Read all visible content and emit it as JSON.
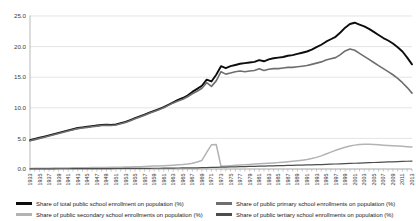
{
  "chart_data": {
    "type": "line",
    "title": "",
    "xlabel": "",
    "ylabel": "",
    "ylim": [
      0,
      25
    ],
    "yticks": [
      "0.0",
      "5.0",
      "10.0",
      "15.0",
      "20.0",
      "25.0"
    ],
    "grid": true,
    "legend_position": "bottom",
    "x": [
      1933,
      1934,
      1935,
      1936,
      1937,
      1938,
      1939,
      1940,
      1941,
      1942,
      1943,
      1944,
      1945,
      1946,
      1947,
      1948,
      1949,
      1950,
      1951,
      1952,
      1953,
      1954,
      1955,
      1956,
      1957,
      1958,
      1959,
      1960,
      1961,
      1962,
      1963,
      1964,
      1965,
      1966,
      1967,
      1968,
      1969,
      1970,
      1971,
      1972,
      1973,
      1974,
      1975,
      1976,
      1977,
      1978,
      1979,
      1980,
      1981,
      1982,
      1983,
      1984,
      1985,
      1986,
      1987,
      1988,
      1989,
      1990,
      1991,
      1992,
      1993,
      1994,
      1995,
      1996,
      1997,
      1998,
      1999,
      2000,
      2001,
      2002,
      2003,
      2004,
      2005,
      2006,
      2007,
      2008,
      2009,
      2010,
      2011,
      2012,
      2013
    ],
    "xticklabels": [
      "1933",
      "1935",
      "1937",
      "1939",
      "1941",
      "1943",
      "1945",
      "1947",
      "1949",
      "1951",
      "1953",
      "1955",
      "1957",
      "1959",
      "1961",
      "1963",
      "1965",
      "1967",
      "1969",
      "1971",
      "1973",
      "1975",
      "1977",
      "1979",
      "1981",
      "1983",
      "1985",
      "1987",
      "1989",
      "1991",
      "1993",
      "1995",
      "1997",
      "1999",
      "2001",
      "2003",
      "2005",
      "2007",
      "2009",
      "2011",
      "2013"
    ],
    "series": [
      {
        "name": "Share of total public school enrollment on population (%)",
        "color": "#0d0d0d",
        "width": 1.9,
        "values": [
          4.7,
          4.9,
          5.1,
          5.3,
          5.5,
          5.7,
          5.9,
          6.1,
          6.3,
          6.5,
          6.7,
          6.8,
          6.9,
          7.0,
          7.1,
          7.2,
          7.25,
          7.2,
          7.3,
          7.5,
          7.7,
          8.0,
          8.3,
          8.6,
          8.9,
          9.2,
          9.5,
          9.8,
          10.1,
          10.5,
          10.9,
          11.3,
          11.6,
          12.0,
          12.6,
          13.1,
          13.6,
          14.6,
          14.3,
          15.4,
          16.8,
          16.5,
          16.8,
          17.0,
          17.2,
          17.3,
          17.4,
          17.5,
          17.8,
          17.6,
          17.9,
          18.1,
          18.2,
          18.3,
          18.5,
          18.6,
          18.8,
          19.0,
          19.2,
          19.5,
          19.9,
          20.3,
          20.8,
          21.2,
          21.6,
          22.3,
          23.1,
          23.7,
          23.9,
          23.6,
          23.3,
          22.9,
          22.4,
          21.9,
          21.4,
          21.0,
          20.5,
          19.9,
          19.2,
          18.2,
          17.1
        ]
      },
      {
        "name": "Share of public primary school enrollments on population (%)",
        "color": "#6e6e6e",
        "width": 1.6,
        "values": [
          4.6,
          4.8,
          5.0,
          5.2,
          5.4,
          5.6,
          5.8,
          6.0,
          6.2,
          6.4,
          6.6,
          6.7,
          6.8,
          6.9,
          7.0,
          7.1,
          7.15,
          7.1,
          7.2,
          7.4,
          7.6,
          7.9,
          8.2,
          8.5,
          8.8,
          9.1,
          9.4,
          9.7,
          10.0,
          10.4,
          10.8,
          11.1,
          11.4,
          11.8,
          12.3,
          12.7,
          13.2,
          14.1,
          13.5,
          14.4,
          15.9,
          15.5,
          15.7,
          15.9,
          16.0,
          15.9,
          16.0,
          16.1,
          16.4,
          16.1,
          16.3,
          16.4,
          16.4,
          16.5,
          16.6,
          16.6,
          16.7,
          16.8,
          16.9,
          17.1,
          17.3,
          17.5,
          17.8,
          18.0,
          18.2,
          18.7,
          19.3,
          19.6,
          19.4,
          18.9,
          18.4,
          17.9,
          17.4,
          16.9,
          16.4,
          15.9,
          15.4,
          14.8,
          14.1,
          13.3,
          12.4
        ]
      },
      {
        "name": "Share of public secondary school enrollments on population (%)",
        "color": "#b3b3b3",
        "width": 1.5,
        "values": [
          0.1,
          0.11,
          0.12,
          0.13,
          0.14,
          0.15,
          0.16,
          0.17,
          0.18,
          0.19,
          0.2,
          0.21,
          0.22,
          0.23,
          0.24,
          0.25,
          0.26,
          0.27,
          0.28,
          0.3,
          0.32,
          0.34,
          0.36,
          0.38,
          0.41,
          0.44,
          0.47,
          0.5,
          0.54,
          0.58,
          0.63,
          0.68,
          0.74,
          0.82,
          0.95,
          1.15,
          1.4,
          2.7,
          3.95,
          4.0,
          0.45,
          0.5,
          0.55,
          0.6,
          0.65,
          0.7,
          0.75,
          0.8,
          0.85,
          0.9,
          0.95,
          1.0,
          1.05,
          1.12,
          1.2,
          1.28,
          1.36,
          1.45,
          1.55,
          1.7,
          1.9,
          2.15,
          2.45,
          2.75,
          3.05,
          3.3,
          3.55,
          3.75,
          3.9,
          4.0,
          4.05,
          4.05,
          4.0,
          3.95,
          3.9,
          3.85,
          3.8,
          3.75,
          3.7,
          3.65,
          3.6
        ]
      },
      {
        "name": "Share of public tertiary school enrollments on population (%)",
        "color": "#4d4d4d",
        "width": 1.2,
        "values": [
          0.02,
          0.02,
          0.02,
          0.03,
          0.03,
          0.03,
          0.04,
          0.04,
          0.04,
          0.05,
          0.05,
          0.05,
          0.06,
          0.06,
          0.06,
          0.07,
          0.07,
          0.07,
          0.08,
          0.08,
          0.09,
          0.09,
          0.1,
          0.1,
          0.11,
          0.11,
          0.12,
          0.12,
          0.13,
          0.14,
          0.15,
          0.16,
          0.17,
          0.18,
          0.19,
          0.2,
          0.22,
          0.24,
          0.26,
          0.28,
          0.3,
          0.32,
          0.34,
          0.36,
          0.38,
          0.4,
          0.42,
          0.44,
          0.46,
          0.48,
          0.5,
          0.52,
          0.54,
          0.56,
          0.58,
          0.6,
          0.62,
          0.64,
          0.66,
          0.68,
          0.7,
          0.73,
          0.76,
          0.79,
          0.82,
          0.85,
          0.88,
          0.91,
          0.94,
          0.97,
          1.0,
          1.03,
          1.06,
          1.09,
          1.12,
          1.15,
          1.18,
          1.21,
          1.24,
          1.27,
          1.3
        ]
      }
    ]
  },
  "legend": {
    "items": [
      {
        "label": "Share of total public school enrollment on population (%)",
        "color": "#0d0d0d",
        "thickness": 3
      },
      {
        "label": "Share of public primary school enrollments on population (%)",
        "color": "#6e6e6e",
        "thickness": 3
      },
      {
        "label": "Share of public secondary school enrollments on population (%)",
        "color": "#b3b3b3",
        "thickness": 3
      },
      {
        "label": "Share of public tertiary school enrollments on population (%)",
        "color": "#4d4d4d",
        "thickness": 3
      }
    ]
  }
}
